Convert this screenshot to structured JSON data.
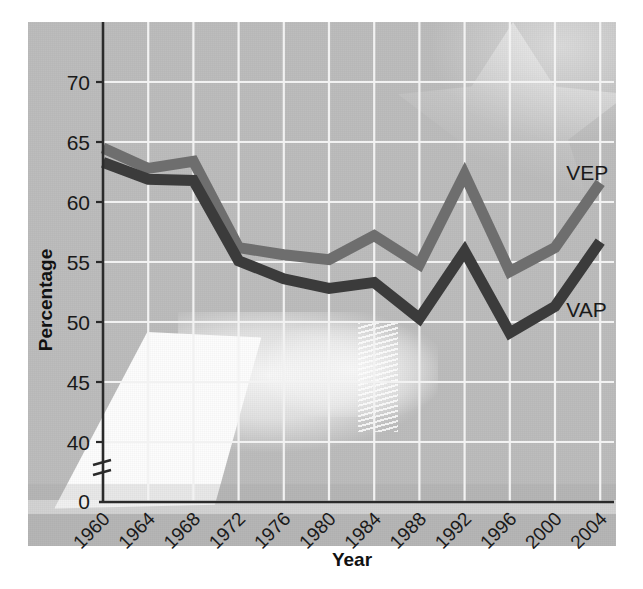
{
  "chart_data": {
    "type": "line",
    "title": "",
    "xlabel": "Year",
    "ylabel": "Percentage",
    "x": [
      1960,
      1964,
      1968,
      1972,
      1976,
      1980,
      1984,
      1988,
      1992,
      1996,
      2000,
      2004
    ],
    "xtick_labels": [
      "1960",
      "1964",
      "1968",
      "1972",
      "1976",
      "1980",
      "1984",
      "1988",
      "1992",
      "1996",
      "2000",
      "2004"
    ],
    "ytick_labels": [
      "0",
      "40",
      "45",
      "50",
      "55",
      "60",
      "65",
      "70"
    ],
    "ytick_values": [
      0,
      40,
      45,
      50,
      55,
      60,
      65,
      70
    ],
    "ylim": [
      40,
      72
    ],
    "xlim": [
      1960,
      2004
    ],
    "axis_break": true,
    "axis_break_note": "y-axis broken between 0 and 40",
    "grid": true,
    "grid_color": "#f2f2f2",
    "legend_position": "inline-right",
    "background_note": "faded photograph of a hand casting a ballot with flag star",
    "series": [
      {
        "name": "VEP",
        "label": "VEP",
        "color": "#6e6e6e",
        "values": [
          64.5,
          62.8,
          63.4,
          56.2,
          55.6,
          55.2,
          57.2,
          54.8,
          62.3,
          54.2,
          56.2,
          61.6
        ]
      },
      {
        "name": "VAP",
        "label": "VAP",
        "color": "#3b3b3b",
        "values": [
          63.3,
          61.9,
          61.8,
          55.1,
          53.6,
          52.8,
          53.3,
          50.3,
          55.9,
          49.1,
          51.3,
          56.7
        ]
      }
    ],
    "annotations": [
      {
        "text": "VEP",
        "x": 2001.0,
        "y": 61.8
      },
      {
        "text": "VAP",
        "x": 2001.0,
        "y": 50.4
      }
    ]
  },
  "colors": {
    "plate_background": "#bdbdbd",
    "page_background": "#ffffff",
    "axis": "#2a2a2a",
    "grid": "#f2f2f2",
    "vep": "#6e6e6e",
    "vap": "#3b3b3b",
    "text": "#1a1a1a"
  }
}
